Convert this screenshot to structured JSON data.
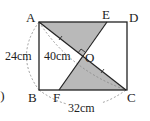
{
  "figure": {
    "points": {
      "A": {
        "label": "A",
        "x": 39,
        "y": 22
      },
      "E": {
        "label": "E",
        "x": 107,
        "y": 22
      },
      "D": {
        "label": "D",
        "x": 127,
        "y": 22
      },
      "B": {
        "label": "B",
        "x": 39,
        "y": 90
      },
      "F": {
        "label": "F",
        "x": 59,
        "y": 90
      },
      "C": {
        "label": "C",
        "x": 126,
        "y": 90
      },
      "O": {
        "label": "O",
        "x": 82,
        "y": 56
      }
    },
    "dimensions": {
      "side_AB": "24cm",
      "diagonal_AC": "40cm",
      "side_BC": "32cm"
    },
    "prefix": ".)",
    "colors": {
      "stroke": "#222222",
      "shade": "#b9b9b9",
      "dashed": "#888888"
    }
  }
}
